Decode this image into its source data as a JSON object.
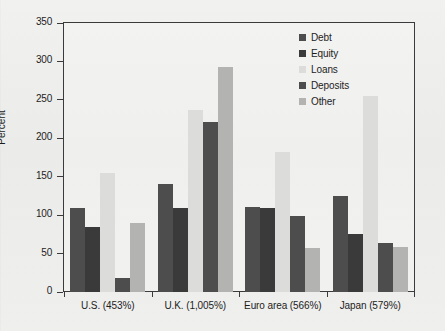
{
  "chart_data": {
    "type": "bar",
    "title": "",
    "subtitle": "",
    "xlabel": "",
    "ylabel": "Percent",
    "ylim": [
      0,
      350
    ],
    "yticks": [
      0,
      50,
      100,
      150,
      200,
      250,
      300,
      350
    ],
    "ytick_labels": [
      "0",
      "50",
      "100",
      "150",
      "200",
      "250",
      "300",
      "350"
    ],
    "grid": false,
    "legend_position": "top-right",
    "categories": [
      "U.S. (453%)",
      "U.K. (1,005%)",
      "Euro area (566%)",
      "Japan (579%)"
    ],
    "series": [
      {
        "name": "Debt",
        "color": "#4d4d4d",
        "values": [
          109,
          141,
          111,
          125
        ]
      },
      {
        "name": "Equity",
        "color": "#3a3a3a",
        "values": [
          85,
          109,
          109,
          76
        ]
      },
      {
        "name": "Loans",
        "color": "#dcdcda",
        "values": [
          155,
          237,
          182,
          255
        ]
      },
      {
        "name": "Deposits",
        "color": "#4d4d4d",
        "values": [
          18,
          221,
          99,
          64
        ]
      },
      {
        "name": "Other",
        "color": "#b3b3b1",
        "values": [
          90,
          293,
          57,
          59
        ]
      }
    ]
  },
  "axis": {
    "y_title": "Percent"
  },
  "legend": {
    "items": [
      {
        "label": "Debt"
      },
      {
        "label": "Equity"
      },
      {
        "label": "Loans"
      },
      {
        "label": "Deposits"
      },
      {
        "label": "Other"
      }
    ]
  }
}
